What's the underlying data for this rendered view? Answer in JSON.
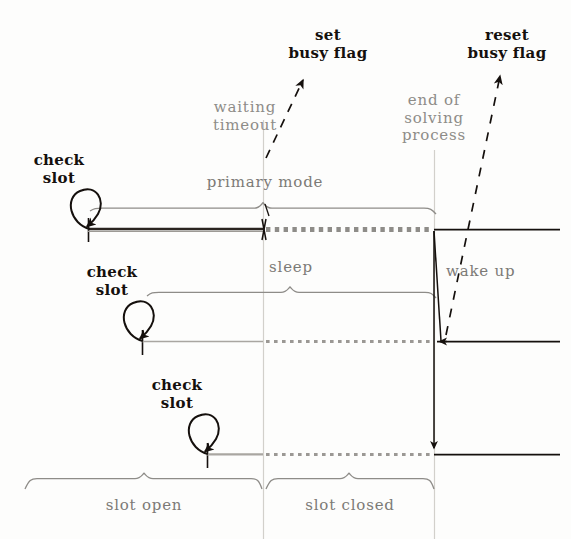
{
  "figure": {
    "type": "timing-diagram",
    "title_present": false,
    "background_color": "#fdfdfc",
    "ink_dark": "#15100d",
    "ink_gray": "#8e8c88",
    "guide_gray": "#cfcdc8"
  },
  "labels": {
    "set_busy_flag": "set\nbusy flag",
    "reset_busy_flag": "reset\nbusy flag",
    "waiting_timeout": "waiting\ntimeout",
    "end_of_solving_process": "end of\nsolving\nprocess",
    "check_slot_1": "check\nslot",
    "check_slot_2": "check\nslot",
    "check_slot_3": "check\nslot",
    "primary_mode": "primary mode",
    "sleep": "sleep",
    "wake_up": "wake up",
    "slot_open": "slot open",
    "slot_closed": "slot closed"
  },
  "timeline_rows": [
    {
      "name": "row-1-primary",
      "y": 229,
      "start_x": 88,
      "solid_end_x": 263,
      "dotted_start_x": 263,
      "dotted_end_x": 434,
      "tail_end_x": 560,
      "brace": {
        "label": "primary mode",
        "x1": 88,
        "x2": 434,
        "y": 208
      }
    },
    {
      "name": "row-2-sleep",
      "y": 341,
      "start_x": 142,
      "solid_end_x": 263,
      "dotted_start_x": 263,
      "dotted_end_x": 434,
      "tail_end_x": 560,
      "brace": {
        "label": "sleep",
        "x1": 150,
        "x2": 434,
        "y": 292
      }
    },
    {
      "name": "row-3-slot",
      "y": 454,
      "start_x": 207,
      "solid_end_x": 263,
      "dotted_start_x": 263,
      "dotted_end_x": 434,
      "tail_end_x": 560,
      "brace": null
    }
  ],
  "check_slot_loops": [
    {
      "name": "check-slot-loop-1",
      "x": 90,
      "y": 229
    },
    {
      "name": "check-slot-loop-2",
      "x": 143,
      "y": 341
    },
    {
      "name": "check-slot-loop-3",
      "x": 208,
      "y": 454
    }
  ],
  "vertical_guides": [
    {
      "name": "guide-waiting-timeout",
      "x": 263,
      "y1": 120,
      "y2": 539
    },
    {
      "name": "guide-end-of-solving",
      "x": 434,
      "y1": 150,
      "y2": 539
    }
  ],
  "dashed_callouts": [
    {
      "name": "set-busy-flag-arrow",
      "x1": 268,
      "y1": 152,
      "x2": 305,
      "y2": 72
    },
    {
      "name": "reset-busy-flag-arrow",
      "x1": 448,
      "y1": 330,
      "x2": 502,
      "y2": 70
    }
  ],
  "bottom_braces": [
    {
      "label": "slot open",
      "x1": 25,
      "x2": 262,
      "y": 478
    },
    {
      "label": "slot closed",
      "x1": 266,
      "x2": 434,
      "y": 478
    }
  ],
  "transition_arrows": [
    {
      "name": "wake-up-arrow-row2",
      "from_x": 434,
      "from_y": 231,
      "to_x": 441,
      "to_y": 341,
      "head": "left"
    },
    {
      "name": "wake-up-arrow-row3",
      "from_x": 434,
      "from_y": 231,
      "to_x": 434,
      "to_y": 452,
      "head": "down"
    }
  ]
}
